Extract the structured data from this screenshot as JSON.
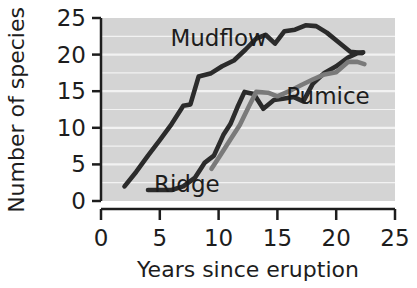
{
  "chart_data": {
    "type": "line",
    "title": "",
    "xlabel": "Years since eruption",
    "ylabel": "Number of species",
    "xlim": [
      0,
      25
    ],
    "ylim": [
      0,
      25
    ],
    "xticks": [
      "0",
      "5",
      "10",
      "15",
      "20",
      "25"
    ],
    "yticks": [
      "0",
      "5",
      "10",
      "15",
      "20",
      "25"
    ],
    "grid": "horizontal white gridlines on gray panel",
    "legend_position": "inline labels on plot",
    "series": [
      {
        "name": "Mudflow",
        "color": "#2b2b2b",
        "label_x": 10.0,
        "label_y": 21.2,
        "points": [
          [
            2.0,
            2.0
          ],
          [
            3.0,
            4.0
          ],
          [
            4.0,
            6.2
          ],
          [
            5.0,
            8.3
          ],
          [
            6.0,
            10.5
          ],
          [
            7.0,
            13.0
          ],
          [
            7.6,
            13.2
          ],
          [
            8.3,
            17.0
          ],
          [
            9.3,
            17.4
          ],
          [
            10.3,
            18.4
          ],
          [
            11.3,
            19.2
          ],
          [
            12.3,
            20.7
          ],
          [
            13.2,
            22.2
          ],
          [
            14.0,
            22.7
          ],
          [
            14.8,
            21.5
          ],
          [
            15.6,
            23.2
          ],
          [
            16.5,
            23.4
          ],
          [
            17.4,
            24.0
          ],
          [
            18.3,
            23.9
          ],
          [
            19.2,
            23.0
          ],
          [
            20.2,
            21.7
          ],
          [
            21.2,
            20.4
          ],
          [
            22.2,
            20.2
          ]
        ]
      },
      {
        "name": "Ridge",
        "color": "#2b2b2b",
        "label_x": 7.3,
        "label_y": 1.2,
        "points": [
          [
            4.0,
            1.5
          ],
          [
            5.0,
            1.5
          ],
          [
            6.0,
            1.5
          ],
          [
            7.0,
            2.0
          ],
          [
            8.0,
            3.2
          ],
          [
            8.8,
            5.2
          ],
          [
            9.6,
            6.2
          ],
          [
            10.4,
            9.0
          ],
          [
            11.0,
            10.5
          ],
          [
            11.6,
            12.8
          ],
          [
            12.2,
            14.9
          ],
          [
            13.0,
            14.6
          ],
          [
            13.8,
            12.6
          ],
          [
            14.7,
            13.8
          ],
          [
            15.6,
            14.0
          ],
          [
            16.4,
            14.2
          ],
          [
            17.2,
            13.6
          ],
          [
            18.0,
            16.0
          ],
          [
            19.0,
            17.5
          ],
          [
            20.0,
            18.4
          ],
          [
            21.0,
            19.6
          ],
          [
            21.8,
            20.2
          ],
          [
            22.3,
            20.3
          ]
        ]
      },
      {
        "name": "Pumice",
        "color": "#7a7a7a",
        "label_x": 19.3,
        "label_y": 13.2,
        "points": [
          [
            9.4,
            4.4
          ],
          [
            10.2,
            6.4
          ],
          [
            11.0,
            8.4
          ],
          [
            11.8,
            10.4
          ],
          [
            12.6,
            13.0
          ],
          [
            13.2,
            14.9
          ],
          [
            14.2,
            14.8
          ],
          [
            15.0,
            14.3
          ],
          [
            16.0,
            15.0
          ],
          [
            17.0,
            15.8
          ],
          [
            18.0,
            16.6
          ],
          [
            19.0,
            17.3
          ],
          [
            20.0,
            17.6
          ],
          [
            21.0,
            19.0
          ],
          [
            21.8,
            19.0
          ],
          [
            22.4,
            18.7
          ]
        ]
      }
    ]
  },
  "axes": {
    "x_title": "Years since eruption",
    "y_title": "Number of species",
    "x_tick_labels": [
      "0",
      "5",
      "10",
      "15",
      "20",
      "25"
    ],
    "y_tick_labels": [
      "0",
      "5",
      "10",
      "15",
      "20",
      "25"
    ]
  },
  "colors": {
    "panel_background": "#d4d4d4",
    "gridline": "#f2f2f2",
    "axis": "#1d1d1d",
    "dark_series": "#2b2b2b",
    "gray_series": "#7a7a7a",
    "page_background": "#ffffff"
  },
  "labels": {
    "mudflow": "Mudflow",
    "ridge": "Ridge",
    "pumice": "Pumice"
  }
}
